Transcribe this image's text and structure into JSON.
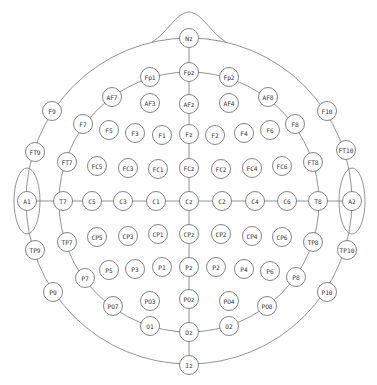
{
  "diagram": {
    "colors": {
      "stroke": "#666666",
      "text": "#333333",
      "background": "#ffffff"
    },
    "electrode_radius": 9.5,
    "electrodes": [
      {
        "id": "Nz",
        "x": 189,
        "y": 38
      },
      {
        "id": "Fpz",
        "x": 189,
        "y": 72
      },
      {
        "id": "AFz",
        "x": 189,
        "y": 104
      },
      {
        "id": "Fz",
        "x": 189,
        "y": 134
      },
      {
        "id": "FCz",
        "x": 189,
        "y": 168
      },
      {
        "id": "Cz",
        "x": 189,
        "y": 201
      },
      {
        "id": "CPz",
        "x": 189,
        "y": 234
      },
      {
        "id": "Pz",
        "x": 189,
        "y": 267
      },
      {
        "id": "POz",
        "x": 189,
        "y": 299
      },
      {
        "id": "Oz",
        "x": 189,
        "y": 332
      },
      {
        "id": "Iz",
        "x": 189,
        "y": 365
      },
      {
        "id": "Fp1",
        "x": 150,
        "y": 77
      },
      {
        "id": "Fp2",
        "x": 229,
        "y": 77
      },
      {
        "id": "AF7",
        "x": 112,
        "y": 97
      },
      {
        "id": "AF3",
        "x": 150,
        "y": 103
      },
      {
        "id": "AF4",
        "x": 229,
        "y": 103
      },
      {
        "id": "AF8",
        "x": 268,
        "y": 97
      },
      {
        "id": "F9",
        "x": 52,
        "y": 111
      },
      {
        "id": "F7",
        "x": 83,
        "y": 124
      },
      {
        "id": "F5",
        "x": 109,
        "y": 130
      },
      {
        "id": "F3",
        "x": 135,
        "y": 133
      },
      {
        "id": "F1",
        "x": 162,
        "y": 135
      },
      {
        "id": "F2",
        "x": 215,
        "y": 135
      },
      {
        "id": "F4",
        "x": 244,
        "y": 133
      },
      {
        "id": "F6",
        "x": 270,
        "y": 130
      },
      {
        "id": "F8",
        "x": 295,
        "y": 124
      },
      {
        "id": "F10",
        "x": 327,
        "y": 111
      },
      {
        "id": "FT9",
        "x": 35,
        "y": 152
      },
      {
        "id": "FT7",
        "x": 67,
        "y": 162
      },
      {
        "id": "FC5",
        "x": 97,
        "y": 166
      },
      {
        "id": "FC3",
        "x": 128,
        "y": 168
      },
      {
        "id": "FC1",
        "x": 158,
        "y": 169
      },
      {
        "id": "FC2",
        "x": 221,
        "y": 169
      },
      {
        "id": "FC4",
        "x": 252,
        "y": 168
      },
      {
        "id": "FC6",
        "x": 282,
        "y": 166
      },
      {
        "id": "FT8",
        "x": 313,
        "y": 162
      },
      {
        "id": "FT10",
        "x": 346,
        "y": 150
      },
      {
        "id": "A1",
        "x": 27,
        "y": 201
      },
      {
        "id": "T7",
        "x": 63,
        "y": 201
      },
      {
        "id": "C5",
        "x": 92,
        "y": 201
      },
      {
        "id": "C3",
        "x": 123,
        "y": 201
      },
      {
        "id": "C1",
        "x": 156,
        "y": 201
      },
      {
        "id": "C2",
        "x": 222,
        "y": 201
      },
      {
        "id": "C4",
        "x": 255,
        "y": 201
      },
      {
        "id": "C6",
        "x": 287,
        "y": 201
      },
      {
        "id": "T8",
        "x": 318,
        "y": 201
      },
      {
        "id": "A2",
        "x": 352,
        "y": 201
      },
      {
        "id": "TP9",
        "x": 35,
        "y": 250
      },
      {
        "id": "TP7",
        "x": 67,
        "y": 242
      },
      {
        "id": "CP5",
        "x": 97,
        "y": 237
      },
      {
        "id": "CP3",
        "x": 128,
        "y": 236
      },
      {
        "id": "CP1",
        "x": 158,
        "y": 234
      },
      {
        "id": "CP2",
        "x": 221,
        "y": 234
      },
      {
        "id": "CP4",
        "x": 252,
        "y": 236
      },
      {
        "id": "CP6",
        "x": 282,
        "y": 237
      },
      {
        "id": "TP8",
        "x": 313,
        "y": 242
      },
      {
        "id": "TP10",
        "x": 347,
        "y": 250
      },
      {
        "id": "P9",
        "x": 53,
        "y": 292
      },
      {
        "id": "P7",
        "x": 85,
        "y": 278
      },
      {
        "id": "P5",
        "x": 109,
        "y": 270
      },
      {
        "id": "P3",
        "x": 135,
        "y": 269
      },
      {
        "id": "P1",
        "x": 162,
        "y": 267
      },
      {
        "id": "P2",
        "x": 216,
        "y": 267
      },
      {
        "id": "P4",
        "x": 244,
        "y": 269
      },
      {
        "id": "P6",
        "x": 270,
        "y": 271
      },
      {
        "id": "P8",
        "x": 296,
        "y": 277
      },
      {
        "id": "P10",
        "x": 327,
        "y": 292
      },
      {
        "id": "PO7",
        "x": 113,
        "y": 306
      },
      {
        "id": "PO3",
        "x": 150,
        "y": 301
      },
      {
        "id": "PO4",
        "x": 229,
        "y": 301
      },
      {
        "id": "PO8",
        "x": 267,
        "y": 306
      },
      {
        "id": "O1",
        "x": 150,
        "y": 326
      },
      {
        "id": "O2",
        "x": 229,
        "y": 326
      }
    ]
  }
}
